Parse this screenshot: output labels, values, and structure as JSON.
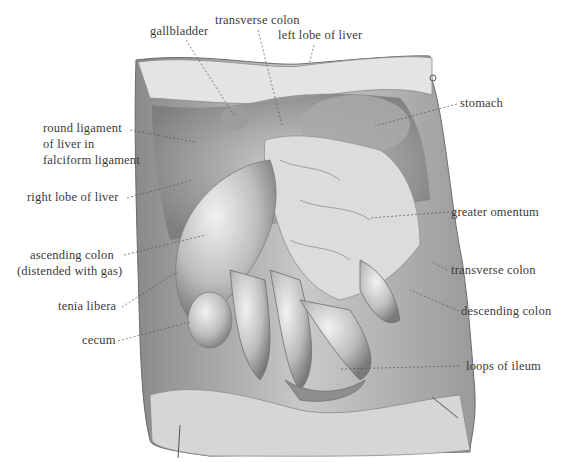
{
  "figure": {
    "labels": {
      "gallbladder": "gallbladder",
      "transverse_colon_top": "transverse colon",
      "left_lobe_of_liver": "left lobe of liver",
      "stomach": "stomach",
      "round_ligament_1": "round ligament",
      "round_ligament_2": "of liver in",
      "round_ligament_3": "falciform ligament",
      "right_lobe_of_liver": "right lobe of liver",
      "greater_omentum": "greater omentum",
      "ascending_colon_1": "ascending colon",
      "ascending_colon_2": "(distended with gas)",
      "transverse_colon_right": "transverse colon",
      "tenia_libera": "tenia libera",
      "descending_colon": "descending colon",
      "cecum": "cecum",
      "loops_of_ileum": "loops of ileum"
    },
    "colors": {
      "background": "#ffffff",
      "text": "#3a3a3a",
      "leader": "#555555",
      "tissue_light": "#e6e6e6",
      "tissue_mid": "#b5b5b5",
      "tissue_dark": "#6e6e6e"
    }
  }
}
